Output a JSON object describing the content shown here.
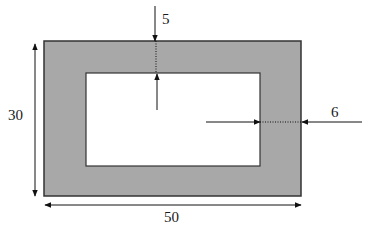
{
  "diagram": {
    "type": "hollow-rectangle-cross-section",
    "colors": {
      "fill": "#a8a8a8",
      "stroke": "#333333",
      "inner": "#ffffff",
      "arrow": "#111111"
    },
    "outer": {
      "x": 44,
      "y": 41,
      "w": 257,
      "h": 155
    },
    "inner": {
      "x": 86,
      "y": 73,
      "w": 174,
      "h": 93
    },
    "labels": {
      "top_thickness": "5",
      "side_thickness": "6",
      "height": "30",
      "width": "50"
    }
  }
}
